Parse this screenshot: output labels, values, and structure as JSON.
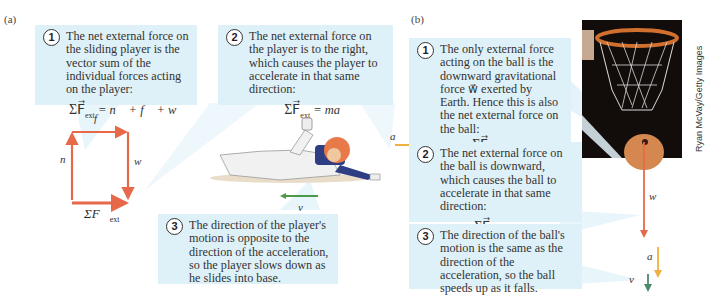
{
  "panel_a": {
    "label": "(a)",
    "callout1": {
      "number": "1",
      "text": "The net external force on the sliding player is the vector sum of the individual forces acting on the player:",
      "equation": {
        "sigma": "ΣF⃗",
        "sub": "ext",
        "rhs": "= n⃗ + f⃗ + w⃗"
      }
    },
    "callout2": {
      "number": "2",
      "text": "The net external force on the player is to the right, which causes the player to accelerate in that same direction:",
      "equation": {
        "sigma": "ΣF⃗",
        "sub": "ext",
        "rhs": "= ma⃗"
      }
    },
    "callout3": {
      "number": "3",
      "text": "The direction of the player's motion is opposite to the direction of the acceleration, so the player slows down as he slides into base."
    },
    "vector_diagram": {
      "f_label": "f⃗",
      "n_label": "n⃗",
      "w_label": "w⃗",
      "net_label": "ΣF⃗",
      "net_sub": "ext",
      "color": "#e8694a"
    },
    "player": {
      "a_label": "a⃗",
      "v_label": "v⃗",
      "a_color": "#f0b040",
      "v_color": "#4a9a4a"
    }
  },
  "panel_b": {
    "label": "(b)",
    "callout1": {
      "number": "1",
      "text": "The only external force acting on the ball is the downward gravitational force w⃗ exerted by Earth. Hence this is also the net external force on the ball:",
      "equation": {
        "sigma": "ΣF⃗",
        "sub": "ext",
        "rhs": "= w⃗"
      }
    },
    "callout2": {
      "number": "2",
      "text": "The net external force on the ball is downward, which causes the ball to accelerate in that same direction:",
      "equation": {
        "sigma": "ΣF⃗",
        "sub": "ext",
        "rhs": "= ma⃗"
      }
    },
    "callout3": {
      "number": "3",
      "text": "The direction of the ball's motion is the same as the direction of the acceleration, so the ball speeds up as it falls."
    },
    "vectors": {
      "w_label": "w⃗",
      "a_label": "a⃗",
      "v_label": "v⃗",
      "w_color": "#e8694a",
      "a_color": "#f0b040",
      "v_color": "#4a8a6a"
    },
    "photo_credit": "Ryan McVay/Getty Images"
  }
}
